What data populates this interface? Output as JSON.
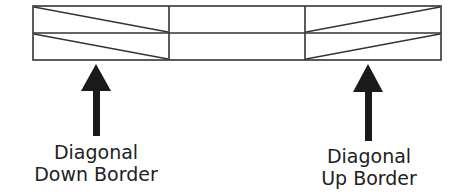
{
  "diagram": {
    "colors": {
      "line": "#333333",
      "arrow": "#1a1a1a",
      "text": "#222222",
      "background": "#ffffff"
    },
    "grid": {
      "rows": 2,
      "columns": 3,
      "cells": [
        [
          {
            "border": "diagonal-down"
          },
          {
            "border": "none"
          },
          {
            "border": "diagonal-up"
          }
        ],
        [
          {
            "border": "diagonal-down"
          },
          {
            "border": "none"
          },
          {
            "border": "diagonal-up"
          }
        ]
      ]
    },
    "callouts": [
      {
        "id": "left",
        "target_column": 0,
        "arrow": "up-arrow",
        "line1": "Diagonal",
        "line2": "Down Border"
      },
      {
        "id": "right",
        "target_column": 2,
        "arrow": "up-arrow",
        "line1": "Diagonal",
        "line2": "Up Border"
      }
    ]
  }
}
